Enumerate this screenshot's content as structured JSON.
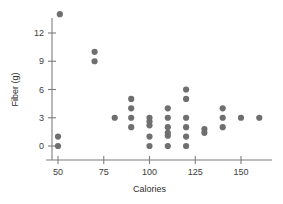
{
  "chart_data": {
    "type": "scatter",
    "title": "",
    "xlabel": "Calories",
    "ylabel": "Fiber (g)",
    "xlim": [
      40,
      172
    ],
    "ylim": [
      -1.2,
      15
    ],
    "grid": false,
    "legend": "none",
    "xticks": [
      50,
      75,
      100,
      125,
      150
    ],
    "xticklabels": [
      "50",
      "75",
      "100",
      "125",
      "150"
    ],
    "yticks": [
      0,
      3,
      6,
      9,
      12
    ],
    "yticklabels": [
      "0",
      "3",
      "6",
      "9",
      "12"
    ],
    "marker": "circle",
    "marker_color": "#6f6f6f",
    "marker_size": 3.1,
    "points": [
      {
        "x": 51,
        "y": 14
      },
      {
        "x": 50,
        "y": 1
      },
      {
        "x": 50,
        "y": 0
      },
      {
        "x": 70,
        "y": 10
      },
      {
        "x": 70,
        "y": 9
      },
      {
        "x": 81,
        "y": 3
      },
      {
        "x": 90,
        "y": 5
      },
      {
        "x": 90,
        "y": 4
      },
      {
        "x": 90,
        "y": 3
      },
      {
        "x": 90,
        "y": 2
      },
      {
        "x": 100,
        "y": 3
      },
      {
        "x": 100,
        "y": 2.6
      },
      {
        "x": 100,
        "y": 2.2
      },
      {
        "x": 100,
        "y": 1
      },
      {
        "x": 100,
        "y": 0
      },
      {
        "x": 110,
        "y": 4
      },
      {
        "x": 110,
        "y": 3
      },
      {
        "x": 110,
        "y": 2
      },
      {
        "x": 110,
        "y": 1.4
      },
      {
        "x": 110,
        "y": 1.1
      },
      {
        "x": 110,
        "y": 0
      },
      {
        "x": 120,
        "y": 6
      },
      {
        "x": 120,
        "y": 5
      },
      {
        "x": 120,
        "y": 3
      },
      {
        "x": 120,
        "y": 2
      },
      {
        "x": 120,
        "y": 1
      },
      {
        "x": 120,
        "y": 0
      },
      {
        "x": 130,
        "y": 1.8
      },
      {
        "x": 130,
        "y": 1.4
      },
      {
        "x": 140,
        "y": 4
      },
      {
        "x": 140,
        "y": 3
      },
      {
        "x": 140,
        "y": 2
      },
      {
        "x": 150,
        "y": 3
      },
      {
        "x": 160,
        "y": 3
      }
    ]
  }
}
